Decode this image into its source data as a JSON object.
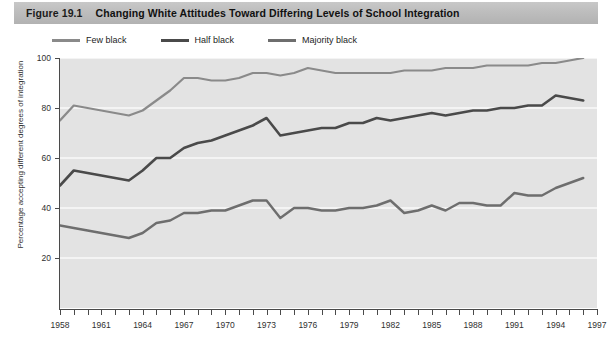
{
  "figure": {
    "label": "Figure 19.1",
    "title": "Changing White Attitudes Toward Differing Levels of School Integration"
  },
  "legend": {
    "position": "top-left",
    "items": [
      {
        "label": "Few black",
        "color": "#8a8a8a"
      },
      {
        "label": "Half black",
        "color": "#4a4a4a"
      },
      {
        "label": "Majority black",
        "color": "#6e6e6e"
      }
    ]
  },
  "axes": {
    "y_title": "Percentage accepting different degrees of integration",
    "y_ticks": [
      "20",
      "40",
      "60",
      "80",
      "100"
    ],
    "x_ticks": [
      "1958",
      "1961",
      "1964",
      "1967",
      "1970",
      "1973",
      "1976",
      "1979",
      "1982",
      "1985",
      "1988",
      "1991",
      "1994",
      "1997"
    ]
  },
  "chart_data": {
    "type": "line",
    "title": "Changing White Attitudes Toward Differing Levels of School Integration",
    "xlabel": "",
    "ylabel": "Percentage accepting different degrees of integration",
    "xlim": [
      1958,
      1997
    ],
    "ylim": [
      0,
      100
    ],
    "grid": true,
    "grid_axis": "y",
    "legend_position": "top-left",
    "x": [
      1958,
      1959,
      1960,
      1961,
      1962,
      1963,
      1964,
      1965,
      1966,
      1967,
      1968,
      1969,
      1970,
      1971,
      1972,
      1973,
      1974,
      1975,
      1976,
      1977,
      1978,
      1979,
      1980,
      1981,
      1982,
      1983,
      1984,
      1985,
      1986,
      1987,
      1988,
      1989,
      1990,
      1991,
      1992,
      1993,
      1994,
      1995,
      1996
    ],
    "series": [
      {
        "name": "Few black",
        "color": "#8a8a8a",
        "values": [
          75,
          81,
          80,
          79,
          78,
          77,
          79,
          83,
          87,
          92,
          92,
          91,
          91,
          92,
          94,
          94,
          93,
          94,
          96,
          95,
          94,
          94,
          94,
          94,
          94,
          95,
          95,
          95,
          96,
          96,
          96,
          97,
          97,
          97,
          97,
          98,
          98,
          99,
          100
        ]
      },
      {
        "name": "Half black",
        "color": "#4a4a4a",
        "values": [
          49,
          55,
          54,
          53,
          52,
          51,
          55,
          60,
          60,
          64,
          66,
          67,
          69,
          71,
          73,
          76,
          69,
          70,
          71,
          72,
          72,
          74,
          74,
          76,
          75,
          76,
          77,
          78,
          77,
          78,
          79,
          79,
          80,
          80,
          81,
          81,
          85,
          84,
          83
        ]
      },
      {
        "name": "Majority black",
        "color": "#6e6e6e",
        "values": [
          33,
          32,
          31,
          30,
          29,
          28,
          30,
          34,
          35,
          38,
          38,
          39,
          39,
          41,
          43,
          43,
          36,
          40,
          40,
          39,
          39,
          40,
          40,
          41,
          43,
          38,
          39,
          41,
          39,
          42,
          42,
          41,
          41,
          46,
          45,
          45,
          48,
          50,
          52
        ]
      }
    ]
  }
}
